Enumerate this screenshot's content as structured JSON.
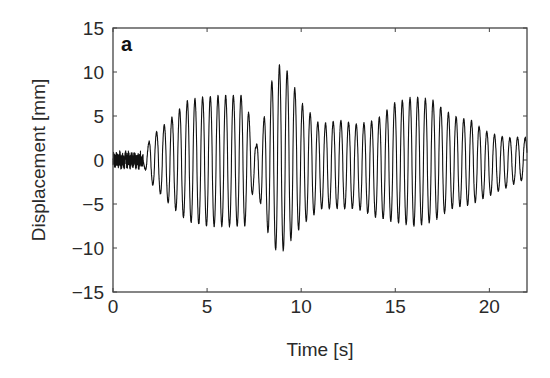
{
  "chart_data": {
    "type": "line",
    "title": "",
    "panel_label": "a",
    "xlabel": "Time [s]",
    "ylabel": "Displacement [mm]",
    "xlim": [
      0,
      22
    ],
    "ylim": [
      -15,
      15
    ],
    "xticks": [
      0,
      5,
      10,
      15,
      20
    ],
    "yticks": [
      -15,
      -10,
      -5,
      0,
      5,
      10,
      15
    ],
    "grid": false,
    "legend": null,
    "line_color": "#111111",
    "series": [
      {
        "name": "Displacement",
        "description": "Oscillating displacement signal (~2.4 Hz) with amplitude-modulated beating envelope; small noise ~±1 mm before t=1.6 s",
        "noise_segment": {
          "t_start": 0,
          "t_end": 1.6,
          "amplitude": 0.9
        },
        "frequency_hz": 2.45,
        "envelope_upper": {
          "t": [
            1.6,
            2.0,
            3.0,
            4.0,
            5.0,
            6.0,
            7.0,
            7.4,
            7.6,
            8.0,
            8.5,
            8.8,
            9.3,
            10.0,
            11.0,
            12.0,
            13.0,
            14.0,
            15.0,
            16.0,
            17.0,
            18.0,
            19.0,
            20.0,
            21.0,
            22.0
          ],
          "v": [
            0.5,
            2.5,
            4.5,
            6.8,
            7.2,
            7.3,
            7.3,
            3.5,
            1.5,
            4.5,
            9.5,
            10.8,
            10.0,
            6.5,
            4.0,
            4.5,
            4.0,
            4.5,
            6.5,
            7.2,
            6.8,
            5.0,
            4.5,
            3.0,
            2.5,
            2.5
          ]
        },
        "envelope_lower": {
          "t": [
            1.6,
            2.0,
            3.0,
            4.0,
            5.0,
            6.0,
            7.0,
            7.4,
            7.6,
            8.0,
            8.5,
            8.8,
            9.3,
            10.0,
            11.0,
            12.0,
            13.0,
            14.0,
            15.0,
            16.0,
            17.0,
            18.0,
            19.0,
            20.0,
            21.0,
            22.0
          ],
          "v": [
            -0.5,
            -2.5,
            -5.0,
            -7.0,
            -7.5,
            -7.5,
            -7.5,
            -4.0,
            -2.0,
            -7.0,
            -9.5,
            -11.0,
            -9.5,
            -7.5,
            -5.5,
            -5.5,
            -5.5,
            -6.5,
            -7.0,
            -7.5,
            -7.0,
            -5.5,
            -5.0,
            -4.0,
            -3.0,
            -2.0
          ]
        },
        "peak_max": {
          "t": 8.8,
          "v": 10.8
        },
        "peak_min": {
          "t": 8.9,
          "v": -11.0
        }
      }
    ]
  }
}
